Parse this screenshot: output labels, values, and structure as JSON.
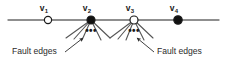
{
  "figure": {
    "type": "graph-diagram",
    "background_color": "#ffffff",
    "line_color": "#6b6b6b",
    "edge_color": "#555555",
    "node_stroke_color": "#1a1a1a",
    "filled_node_color": "#111111",
    "hollow_node_color": "#ffffff",
    "text_color": "#2b2b2b"
  },
  "axis_line": {
    "name": "horizontal-path-line",
    "x1": 8,
    "y1": 20,
    "x2": 219,
    "y2": 20
  },
  "vertices": [
    {
      "id": "v1",
      "label": "v",
      "subscript": "1",
      "cx": 48,
      "cy": 20,
      "r": 3.6,
      "fill": "hollow",
      "label_x": 44,
      "label_y": 11
    },
    {
      "id": "v2",
      "label": "v",
      "subscript": "2",
      "cx": 91,
      "cy": 20,
      "r": 4.0,
      "fill": "filled",
      "label_x": 87,
      "label_y": 11
    },
    {
      "id": "v3",
      "label": "v",
      "subscript": "3",
      "cx": 134,
      "cy": 20,
      "r": 4.0,
      "fill": "hollow",
      "label_x": 130,
      "label_y": 11
    },
    {
      "id": "v4",
      "label": "v",
      "subscript": "4",
      "cx": 178,
      "cy": 20,
      "r": 4.2,
      "fill": "filled",
      "label_x": 174,
      "label_y": 11
    }
  ],
  "fan_groups": [
    {
      "name": "fault-edge-fan-v2",
      "origin_vertex": "v2",
      "origin_x": 91,
      "origin_y": 20,
      "ellipsis": "•••",
      "ellipsis_x": 91,
      "ellipsis_y": 34,
      "edge_endpoints": [
        {
          "x": 66,
          "y": 38
        },
        {
          "x": 74,
          "y": 39
        },
        {
          "x": 82,
          "y": 40
        },
        {
          "x": 101,
          "y": 40
        },
        {
          "x": 110,
          "y": 38
        }
      ]
    },
    {
      "name": "fault-edge-fan-v3",
      "origin_vertex": "v3",
      "origin_x": 134,
      "origin_y": 20,
      "ellipsis": "•••",
      "ellipsis_x": 134,
      "ellipsis_y": 34,
      "edge_endpoints": [
        {
          "x": 110,
          "y": 38
        },
        {
          "x": 118,
          "y": 39
        },
        {
          "x": 126,
          "y": 40
        },
        {
          "x": 144,
          "y": 40
        },
        {
          "x": 153,
          "y": 38
        }
      ]
    }
  ],
  "annotations": [
    {
      "name": "fault-edges-label-left",
      "text": "Fault edges",
      "text_x": 12,
      "text_y": 54,
      "anchor": "start",
      "leader": {
        "from_x": 65,
        "from_y": 52,
        "to_x": 83,
        "to_y": 38
      }
    },
    {
      "name": "fault-edges-label-right",
      "text": "Fault edges",
      "text_x": 157,
      "text_y": 54,
      "anchor": "start",
      "leader": {
        "from_x": 154,
        "from_y": 52,
        "to_x": 137,
        "to_y": 38
      }
    }
  ]
}
